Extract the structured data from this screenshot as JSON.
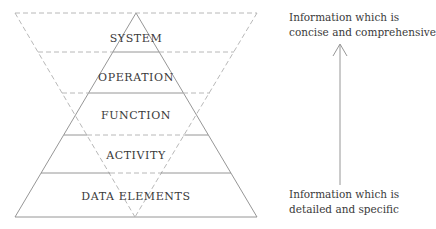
{
  "diagram": {
    "type": "information-hierarchy",
    "pyramid_levels": [
      {
        "id": "system",
        "label": "SYSTEM"
      },
      {
        "id": "operation",
        "label": "OPERATION"
      },
      {
        "id": "function",
        "label": "FUNCTION"
      },
      {
        "id": "activity",
        "label": "ACTIVITY"
      },
      {
        "id": "data-elements",
        "label": "DATA ELEMENTS"
      }
    ],
    "arrow": {
      "direction": "up",
      "top_label": [
        "Information which is",
        "concise and comprehensive"
      ],
      "bottom_label": [
        "Information which is",
        "detailed and specific"
      ]
    },
    "colors": {
      "solid_line": "#8a8a8a",
      "dashed_line": "#b0b0b0",
      "text": "#3a3a3a"
    }
  }
}
